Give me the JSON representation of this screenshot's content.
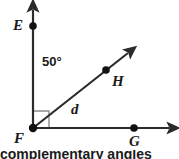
{
  "figure": {
    "name": "angle-diagram-EFH-HFG",
    "background_color": "#ffffff",
    "stroke_color": "#2b2b2b",
    "marker_color": "#808080",
    "vertex": {
      "label": "F",
      "x": 33,
      "y": 128
    },
    "rays": [
      {
        "name": "ray-FE",
        "label": "E",
        "direction": "up",
        "point_label": "E",
        "point_x": 33,
        "point_y": 26,
        "arrow_tip_x": 33,
        "arrow_tip_y": 3
      },
      {
        "name": "ray-FH",
        "label": "H",
        "direction": "up-right",
        "point_label": "H",
        "point_x": 106,
        "point_y": 70,
        "arrow_tip_x": 134,
        "arrow_tip_y": 48
      },
      {
        "name": "ray-FG",
        "label": "G",
        "direction": "right",
        "point_label": "G",
        "point_x": 134,
        "point_y": 128,
        "arrow_tip_x": 176,
        "arrow_tip_y": 128
      }
    ],
    "angle_measure": "50°",
    "segment_label": "d",
    "right_angle_marker": true,
    "caption": "complementary angles"
  }
}
